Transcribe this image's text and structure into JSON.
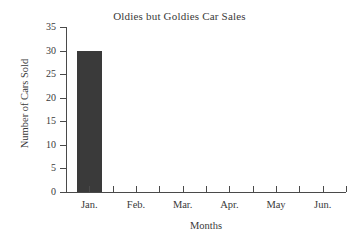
{
  "chart_data": {
    "type": "bar",
    "title": "Oldies but Goldies Car Sales",
    "xlabel": "Months",
    "ylabel": "Number of Cars Sold",
    "categories": [
      "Jan.",
      "Feb.",
      "Mar.",
      "Apr.",
      "May",
      "Jun."
    ],
    "values": [
      30,
      0,
      0,
      0,
      0,
      0
    ],
    "ylim": [
      0,
      35
    ],
    "ytick_labels": [
      "0",
      "5",
      "10",
      "15",
      "20",
      "25",
      "30",
      "35"
    ],
    "ytick_values": [
      0,
      5,
      10,
      15,
      20,
      25,
      30,
      35
    ],
    "grid": false,
    "legend": "none",
    "bar_color": "#3a3a3a",
    "axis_color": "#4a4a4a",
    "background_color": "#ffffff",
    "text_color": "#3a3a3a"
  }
}
